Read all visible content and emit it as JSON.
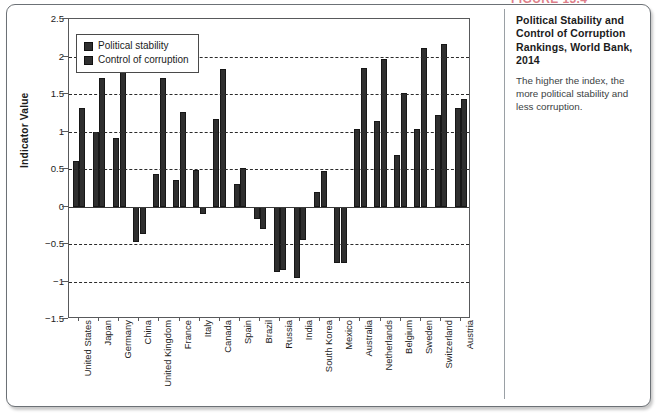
{
  "figure": {
    "label": "FIGURE 13.4",
    "accent": "#c4142b"
  },
  "caption": {
    "title": "Political Stability and Control of Corruption Rankings, World Bank, 2014",
    "body": "The higher the index, the more political stability and less corruption."
  },
  "legend": {
    "items": [
      {
        "label": "Political stability",
        "color": "#2f2f2f"
      },
      {
        "label": "Control of corruption",
        "color": "#2f2f2f"
      }
    ]
  },
  "axis": {
    "y_title": "Indicator Value",
    "y_ticks": [
      "2.5",
      "2",
      "1.5",
      "1",
      "0.5",
      "0",
      "-0.5",
      "-1",
      "-1.5"
    ]
  },
  "chart_data": {
    "type": "bar",
    "title": "Political Stability and Control of Corruption Rankings, World Bank, 2014",
    "xlabel": "",
    "ylabel": "Indicator Value",
    "ylim": [
      -1.5,
      2.5
    ],
    "ytick_step": 0.5,
    "grid": true,
    "legend_position": "inside-top-left",
    "categories": [
      "United States",
      "Japan",
      "Germany",
      "China",
      "United Kingdom",
      "France",
      "Italy",
      "Canada",
      "Spain",
      "Brazil",
      "Russia",
      "India",
      "South Korea",
      "Mexico",
      "Australia",
      "Netherlands",
      "Belgium",
      "Sweden",
      "Switzerland",
      "Austria"
    ],
    "series": [
      {
        "name": "Political stability",
        "values": [
          0.61,
          1.0,
          0.92,
          -0.47,
          0.44,
          0.35,
          0.49,
          1.17,
          0.3,
          -0.17,
          -0.87,
          -0.95,
          0.2,
          -0.75,
          1.04,
          1.14,
          0.69,
          1.04,
          1.22,
          1.31
        ]
      },
      {
        "name": "Control of corruption",
        "values": [
          1.31,
          1.72,
          1.81,
          -0.36,
          1.72,
          1.26,
          -0.1,
          1.84,
          0.52,
          -0.3,
          -0.85,
          -0.45,
          0.48,
          -0.75,
          1.85,
          1.97,
          1.52,
          2.12,
          2.17,
          1.43
        ]
      }
    ]
  }
}
